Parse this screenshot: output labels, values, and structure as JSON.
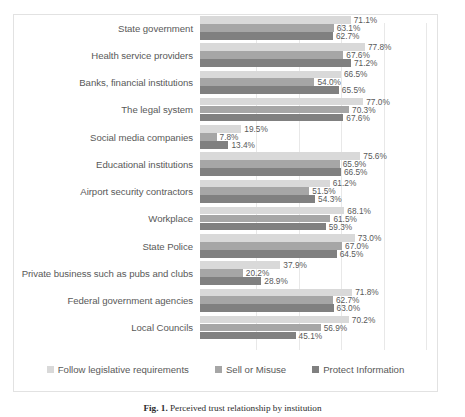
{
  "figure": {
    "caption_number": "Fig. 1.",
    "caption_text": "Perceived trust relationship by institution"
  },
  "legend": {
    "position": "bottom-center",
    "items": [
      {
        "label": "Follow legislative requirements",
        "color": "#d9d9d9",
        "swatch_name": "legend-swatch-follow-legislative-requirements"
      },
      {
        "label": "Sell or Misuse",
        "color": "#a6a6a6",
        "swatch_name": "legend-swatch-sell-or-misuse"
      },
      {
        "label": "Protect Information",
        "color": "#808080",
        "swatch_name": "legend-swatch-protect-information"
      }
    ]
  },
  "chart_data": {
    "type": "bar",
    "orientation": "horizontal",
    "title": "",
    "xlabel": "",
    "ylabel": "",
    "xlim": [
      0,
      100
    ],
    "xunit": "%",
    "grid": true,
    "gridlines": [
      20,
      40,
      60,
      80,
      100
    ],
    "data_labels": true,
    "categories": [
      "State government",
      "Health service providers",
      "Banks, financial institutions",
      "The legal system",
      "Social media companies",
      "Educational institutions",
      "Airport security contractors",
      "Workplace",
      "State Police",
      "Private business such as pubs and clubs",
      "Federal government agencies",
      "Local Councils"
    ],
    "series": [
      {
        "name": "Follow legislative requirements",
        "color": "#d9d9d9",
        "values": [
          71.1,
          77.8,
          66.5,
          77.0,
          19.5,
          75.6,
          61.2,
          68.1,
          73.0,
          37.9,
          71.8,
          70.2
        ],
        "labels": [
          "71.1%",
          "77.8%",
          "66.5%",
          "77.0%",
          "19.5%",
          "75.6%",
          "61.2%",
          "68.1%",
          "73.0%",
          "37.9%",
          "71.8%",
          "70.2%"
        ]
      },
      {
        "name": "Sell or Misuse",
        "color": "#a6a6a6",
        "values": [
          63.1,
          67.6,
          54.0,
          70.3,
          7.8,
          65.9,
          51.5,
          61.5,
          67.0,
          20.2,
          62.7,
          56.9
        ],
        "labels": [
          "63.1%",
          "67.6%",
          "54.0%",
          "70.3%",
          "7.8%",
          "65.9%",
          "51.5%",
          "61.5%",
          "67.0%",
          "20.2%",
          "62.7%",
          "56.9%"
        ]
      },
      {
        "name": "Protect Information",
        "color": "#808080",
        "values": [
          62.7,
          71.2,
          65.5,
          67.6,
          13.4,
          66.5,
          54.3,
          59.3,
          64.5,
          28.9,
          63.0,
          45.1
        ],
        "labels": [
          "62.7%",
          "71.2%",
          "65.5%",
          "67.6%",
          "13.4%",
          "66.5%",
          "54.3%",
          "59.3%",
          "64.5%",
          "28.9%",
          "63.0%",
          "45.1%"
        ]
      }
    ]
  }
}
